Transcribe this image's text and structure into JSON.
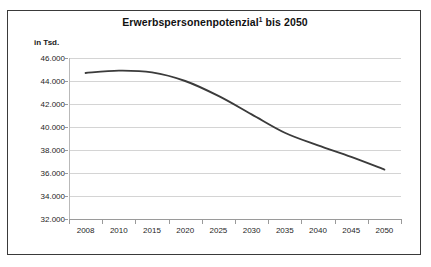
{
  "chart_data": {
    "type": "line",
    "title_main": "Erwerbspersonenpotenzial",
    "title_footnote_marker": "1",
    "title_suffix": " bis 2050",
    "unit_label": "in Tsd.",
    "xlabel": "",
    "ylabel": "",
    "x": [
      2008,
      2010,
      2015,
      2020,
      2025,
      2030,
      2035,
      2040,
      2045,
      2050
    ],
    "categories": [
      "2008",
      "2010",
      "2015",
      "2020",
      "2025",
      "2030",
      "2035",
      "2040",
      "2045",
      "2050"
    ],
    "values": [
      44700,
      44900,
      44750,
      44000,
      42700,
      41100,
      39500,
      38400,
      37400,
      36300
    ],
    "series": [
      {
        "name": "Erwerbspersonenpotenzial",
        "values": [
          44700,
          44900,
          44750,
          44000,
          42700,
          41100,
          39500,
          38400,
          37400,
          36300
        ],
        "color": "#3b3b3b"
      }
    ],
    "ylim": [
      32000,
      46000
    ],
    "ytick_values": [
      46000,
      44000,
      42000,
      40000,
      38000,
      36000,
      34000,
      32000
    ],
    "ytick_labels": [
      "46.000",
      "44.000",
      "42.000",
      "40.000",
      "38.000",
      "36.000",
      "34.000",
      "32.000"
    ],
    "grid": true,
    "grid_axis": "y",
    "legend": false,
    "legend_position": "none",
    "line_color": "#3b3b3b",
    "grid_color": "#d4d4d4",
    "frame_color": "#3a3a3a",
    "background_color": "#ffffff"
  }
}
